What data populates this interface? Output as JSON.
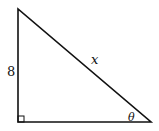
{
  "diagram": {
    "type": "right-triangle",
    "labels": {
      "vertical_leg": "8",
      "hypotenuse": "x",
      "angle": "θ"
    },
    "right_angle_marker": true,
    "colors": {
      "stroke": "#111111",
      "background": "#ffffff"
    }
  }
}
